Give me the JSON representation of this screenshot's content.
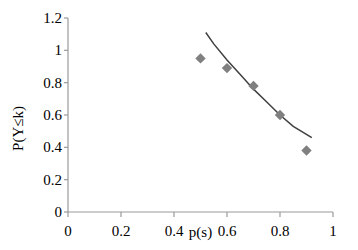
{
  "chart_data": {
    "type": "scatter",
    "title": "",
    "subtitle": "",
    "xlabel": "p(s)",
    "ylabel": "P(Y≤k)",
    "xlim": [
      0,
      1
    ],
    "ylim": [
      0,
      1.2
    ],
    "grid": false,
    "legend": "none",
    "x_ticks": [
      "0",
      "0.2",
      "0.4",
      "0.6",
      "0.8",
      "1"
    ],
    "x_tick_values": [
      0,
      0.2,
      0.4,
      0.6,
      0.8,
      1
    ],
    "y_ticks": [
      "0",
      "0.2",
      "0.4",
      "0.6",
      "0.8",
      "1",
      "1.2"
    ],
    "y_tick_values": [
      0,
      0.2,
      0.4,
      0.6,
      0.8,
      1,
      1.2
    ],
    "marker_shape": "diamond",
    "marker_color": "#808080",
    "line_color": "#404040",
    "axis_color": "#868686",
    "series": [
      {
        "name": "observed",
        "type": "scatter",
        "x": [
          0.5,
          0.6,
          0.7,
          0.8,
          0.9
        ],
        "values": [
          0.95,
          0.89,
          0.78,
          0.6,
          0.38
        ]
      },
      {
        "name": "fitted curve",
        "type": "line",
        "x": [
          0.52,
          0.55,
          0.6,
          0.65,
          0.7,
          0.75,
          0.8,
          0.85,
          0.92
        ],
        "values": [
          1.11,
          1.04,
          0.94,
          0.85,
          0.76,
          0.68,
          0.6,
          0.53,
          0.46
        ]
      }
    ],
    "annotations": []
  }
}
